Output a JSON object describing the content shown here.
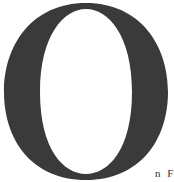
{
  "document": {
    "drop_cap": {
      "letter": "O",
      "color": "#3a3a3a"
    },
    "following_text": "n F"
  }
}
